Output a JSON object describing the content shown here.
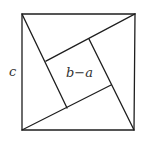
{
  "diagram": {
    "labels": {
      "side": "c",
      "inner_square": "b−a"
    },
    "colors": {
      "stroke": "#1e1e1e",
      "label": "#333333",
      "background": "#ffffff"
    },
    "outer_square": {
      "tl": [
        22,
        14
      ],
      "tr": [
        135,
        14
      ],
      "br": [
        134,
        130
      ],
      "bl": [
        22,
        130
      ]
    },
    "inner_square": {
      "tl": [
        46,
        61
      ],
      "tr": [
        89,
        39
      ],
      "br": [
        111,
        85
      ],
      "bl": [
        67,
        108
      ]
    },
    "shapes": [
      "outer-square",
      "triangle-top",
      "triangle-right",
      "triangle-bottom",
      "triangle-left",
      "inner-square"
    ]
  }
}
